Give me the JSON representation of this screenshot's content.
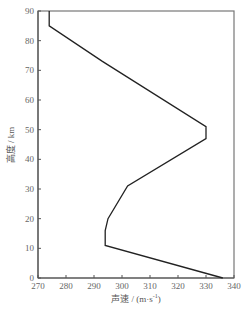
{
  "chart_data": {
    "type": "line",
    "title": "",
    "xlabel": "声速 / (m·s⁻¹)",
    "ylabel": "高度 / km",
    "xlim": [
      270,
      340
    ],
    "ylim": [
      0,
      90
    ],
    "x_ticks": [
      270,
      280,
      290,
      300,
      310,
      320,
      330,
      340
    ],
    "y_ticks": [
      0,
      10,
      20,
      30,
      40,
      50,
      60,
      70,
      80,
      90
    ],
    "grid": false,
    "legend": null,
    "series": [
      {
        "name": "sound-speed-profile",
        "color": "#222222",
        "points": [
          {
            "speed": 336,
            "altitude": 0
          },
          {
            "speed": 294,
            "altitude": 11
          },
          {
            "speed": 294,
            "altitude": 16
          },
          {
            "speed": 295,
            "altitude": 20
          },
          {
            "speed": 302,
            "altitude": 31
          },
          {
            "speed": 330,
            "altitude": 47
          },
          {
            "speed": 330,
            "altitude": 51
          },
          {
            "speed": 293,
            "altitude": 73
          },
          {
            "speed": 274,
            "altitude": 85
          },
          {
            "speed": 274,
            "altitude": 90
          }
        ]
      }
    ]
  }
}
